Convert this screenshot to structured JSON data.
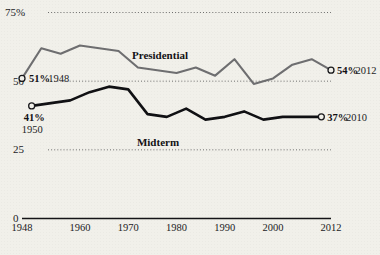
{
  "chart_data": {
    "type": "line",
    "title": "",
    "xlabel": "",
    "ylabel": "",
    "xlim": [
      1948,
      2012
    ],
    "ylim": [
      0,
      75
    ],
    "grid": "horizontal dotted gridlines at 25, 50, 75",
    "legend": "inline series labels on plot",
    "y_ticks": [
      {
        "value": 75,
        "label": "75%"
      },
      {
        "value": 50,
        "label": "50"
      },
      {
        "value": 25,
        "label": "25"
      },
      {
        "value": 0,
        "label": "0"
      }
    ],
    "x_ticks": [
      {
        "value": 1948,
        "label": "1948"
      },
      {
        "value": 1960,
        "label": "1960"
      },
      {
        "value": 1970,
        "label": "1970"
      },
      {
        "value": 1980,
        "label": "1980"
      },
      {
        "value": 1990,
        "label": "1990"
      },
      {
        "value": 2000,
        "label": "2000"
      },
      {
        "value": 2012,
        "label": "2012"
      }
    ],
    "series": [
      {
        "name": "Presidential",
        "color": "#6e6e70",
        "x": [
          1948,
          1952,
          1956,
          1960,
          1964,
          1968,
          1972,
          1976,
          1980,
          1984,
          1988,
          1992,
          1996,
          2000,
          2004,
          2008,
          2012
        ],
        "values": [
          51,
          62,
          60,
          63,
          62,
          61,
          55,
          54,
          53,
          55,
          52,
          58,
          49,
          51,
          56,
          58,
          54
        ]
      },
      {
        "name": "Midterm",
        "color": "#101013",
        "x": [
          1950,
          1954,
          1958,
          1962,
          1966,
          1970,
          1974,
          1978,
          1982,
          1986,
          1990,
          1994,
          1998,
          2002,
          2006,
          2010
        ],
        "values": [
          41,
          42,
          43,
          46,
          48,
          47,
          38,
          37,
          40,
          36,
          37,
          39,
          36,
          37,
          37,
          37
        ]
      }
    ],
    "annotations": [
      {
        "id": "pres-start",
        "bold": "51%",
        "plain": "1948",
        "x": 1948,
        "y": 51,
        "marker": "open-circle"
      },
      {
        "id": "pres-end",
        "bold": "54%",
        "plain": "2012",
        "x": 2012,
        "y": 54,
        "marker": "open-circle"
      },
      {
        "id": "mid-start",
        "bold": "41%",
        "plain": "1950",
        "x": 1950,
        "y": 41,
        "marker": "open-circle"
      },
      {
        "id": "mid-end",
        "bold": "37%",
        "plain": "2010",
        "x": 2010,
        "y": 37,
        "marker": "open-circle"
      }
    ],
    "series_labels": [
      {
        "text": "Presidential",
        "px": 160,
        "py": 59
      },
      {
        "text": "Midterm",
        "px": 158,
        "py": 146
      }
    ]
  },
  "colors": {
    "background": "#f1f0ea",
    "ink": "#17171a",
    "presidential": "#6e6e70",
    "midterm": "#101013",
    "grid": "#5d5d5d"
  }
}
